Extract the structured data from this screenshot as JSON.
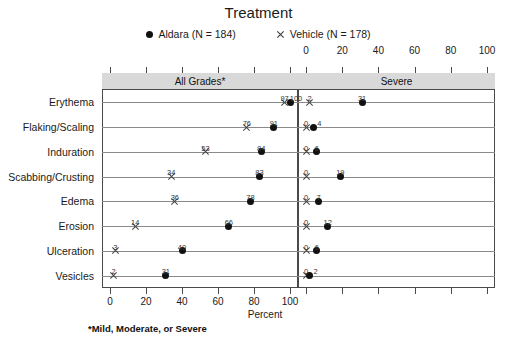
{
  "title": "Treatment",
  "legend": [
    {
      "marker": "filled-circle",
      "label": "Aldara (N = 184)"
    },
    {
      "marker": "x-cross",
      "label": "Vehicle (N = 178)"
    }
  ],
  "panels": [
    {
      "header": "All Grades*"
    },
    {
      "header": "Severe"
    }
  ],
  "axis": {
    "xlabel": "Percent",
    "ticks": [
      0,
      20,
      40,
      60,
      80,
      100
    ],
    "tick_labels": [
      "0",
      "20",
      "40",
      "60",
      "80",
      "100"
    ]
  },
  "footnote": "*Mild, Moderate, or Severe",
  "chart_data": {
    "type": "scatter",
    "title": "Treatment",
    "xlabel": "Percent",
    "ylabel": "",
    "xlim": [
      0,
      100
    ],
    "grid": false,
    "legend_position": "top-center",
    "panels": [
      "All Grades*",
      "Severe"
    ],
    "categories": [
      "Erythema",
      "Flaking/Scaling",
      "Induration",
      "Scabbing/Crusting",
      "Edema",
      "Erosion",
      "Ulceration",
      "Vesicles"
    ],
    "series": [
      {
        "name": "Aldara (N = 184)",
        "marker": "filled-circle",
        "all_grades": [
          100,
          91,
          84,
          83,
          78,
          66,
          40,
          31
        ],
        "severe": [
          31,
          4,
          6,
          19,
          7,
          12,
          6,
          2
        ]
      },
      {
        "name": "Vehicle (N = 178)",
        "marker": "x-cross",
        "all_grades": [
          97,
          76,
          53,
          34,
          36,
          14,
          3,
          2
        ],
        "severe": [
          2,
          0,
          0,
          0,
          0,
          0,
          0,
          0
        ]
      }
    ]
  }
}
